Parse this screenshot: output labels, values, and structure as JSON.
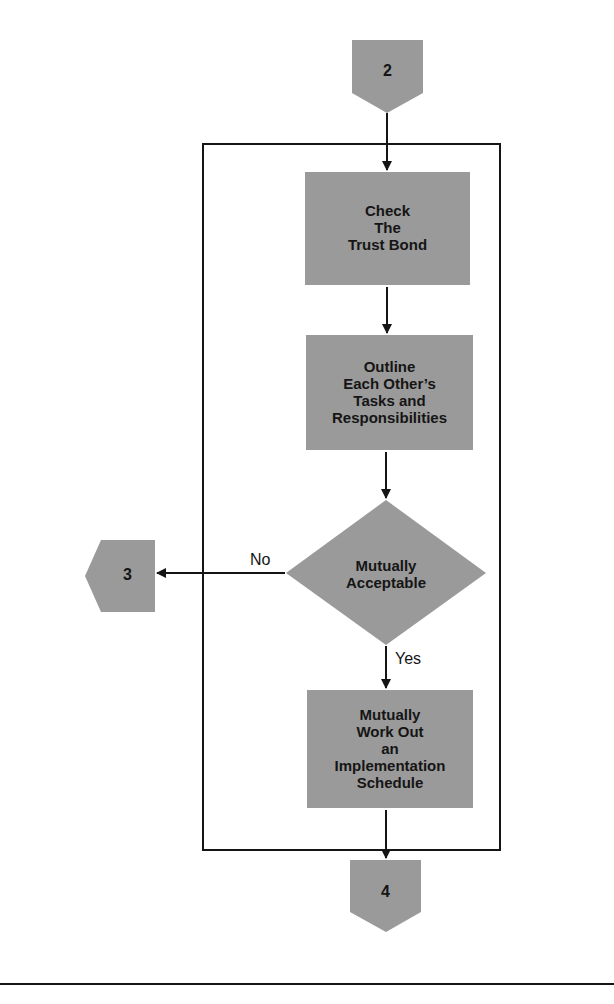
{
  "diagram": {
    "type": "flowchart",
    "fill_color": "#9a9a9a",
    "line_color": "#151515",
    "connectors": {
      "entry": {
        "label": "2",
        "shape": "down-pentagon"
      },
      "exit_no": {
        "label": "3",
        "shape": "left-pentagon"
      },
      "exit_end": {
        "label": "4",
        "shape": "down-pentagon"
      }
    },
    "nodes": [
      {
        "id": "check-trust-bond",
        "shape": "rectangle",
        "lines": [
          "Check",
          "The",
          "Trust Bond"
        ]
      },
      {
        "id": "outline-tasks",
        "shape": "rectangle",
        "lines": [
          "Outline",
          "Each Other’s",
          "Tasks and",
          "Responsibilities"
        ]
      },
      {
        "id": "mutually-acceptable",
        "shape": "diamond",
        "lines": [
          "Mutually",
          "Acceptable"
        ]
      },
      {
        "id": "work-out-schedule",
        "shape": "rectangle",
        "lines": [
          "Mutually",
          "Work Out",
          "an",
          "Implementation",
          "Schedule"
        ]
      }
    ],
    "edges": {
      "no_label": "No",
      "yes_label": "Yes"
    }
  }
}
